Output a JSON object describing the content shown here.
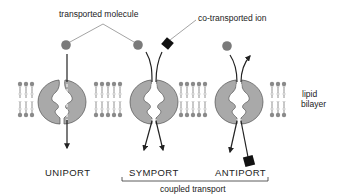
{
  "labels": {
    "transported_molecule": "transported molecule",
    "co_transported_ion": "co-transported ion",
    "lipid": "lipid",
    "bilayer": "bilayer",
    "uniport": "UNIPORT",
    "symport": "SYMPORT",
    "antiport": "ANTIPORT",
    "coupled_transport": "coupled transport"
  },
  "colors": {
    "protein_fill": "#a9a9a9",
    "molecule_fill": "#7a7a7a",
    "ion_fill": "#111111",
    "line": "#222222",
    "lipid_head": "#8a8a8a"
  },
  "transporters": [
    {
      "name": "uniport",
      "molecules": [
        "transported molecule"
      ],
      "direction": "in"
    },
    {
      "name": "symport",
      "molecules": [
        "transported molecule",
        "co-transported ion"
      ],
      "direction": "same"
    },
    {
      "name": "antiport",
      "molecules": [
        "transported molecule",
        "co-transported ion"
      ],
      "direction": "opposite"
    }
  ]
}
